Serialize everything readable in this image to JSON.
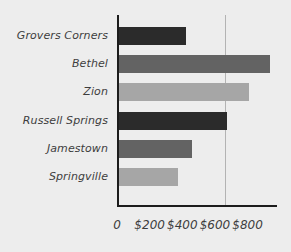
{
  "chart_data": {
    "type": "bar",
    "orientation": "horizontal",
    "title": "",
    "subtitle": "",
    "xlabel": "",
    "ylabel": "",
    "categories": [
      "Grovers Corners",
      "Bethel",
      "Zion",
      "Russell Springs",
      "Jamestown",
      "Springville"
    ],
    "values": [
      410,
      925,
      795,
      660,
      445,
      360
    ],
    "xlim": [
      0,
      980
    ],
    "xticks": [
      0,
      200,
      400,
      600,
      800
    ],
    "xtick_labels": [
      "0",
      "$200",
      "$400",
      "$600",
      "$800"
    ],
    "grid": true,
    "gridlines": [
      660
    ],
    "legend": "none",
    "bar_colors": [
      "#2b2b2b",
      "#636363",
      "#a6a6a6",
      "#2b2b2b",
      "#636363",
      "#a6a6a6"
    ],
    "series": [
      {
        "name": "",
        "values": [
          410,
          925,
          795,
          660,
          445,
          360
        ]
      }
    ]
  },
  "style": {
    "background": "#ededed",
    "axis_color": "#1c1c1c",
    "grid_color": "#b3b3b3",
    "label_color": "#3d3d3d",
    "color_dark": "#2b2b2b",
    "color_medium": "#636363",
    "color_light": "#a6a6a6"
  },
  "labels": {
    "cat_0": "Grovers Corners",
    "cat_1": "Bethel",
    "cat_2": "Zion",
    "cat_3": "Russell Springs",
    "cat_4": "Jamestown",
    "cat_5": "Springville",
    "tick_0": "0",
    "tick_1": "$200",
    "tick_2": "$400",
    "tick_3": "$600",
    "tick_4": "$800"
  }
}
